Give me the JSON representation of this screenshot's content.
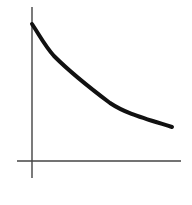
{
  "chart_data": {
    "type": "line",
    "title": "",
    "xlabel": "",
    "ylabel": "",
    "grid": false,
    "legend": null,
    "series": [
      {
        "name": "curve",
        "x": [
          0,
          0.14,
          0.31,
          0.56,
          0.77,
          1.0
        ],
        "y": [
          1.0,
          0.78,
          0.62,
          0.43,
          0.34,
          0.26
        ]
      }
    ],
    "xlim": [
      0,
      1
    ],
    "ylim": [
      0,
      1
    ],
    "colors": {
      "curve": "#111111",
      "axes": "#333333"
    }
  },
  "geometry": {
    "y_axis": {
      "x": 32,
      "y1": 7,
      "y2": 178
    },
    "x_axis": {
      "y": 161,
      "x1": 17,
      "x2": 181
    },
    "curve_path": "M32,24 C40,36 45,46 54,56 C68,70 90,88 110,103 C125,113 140,117 172,127"
  }
}
